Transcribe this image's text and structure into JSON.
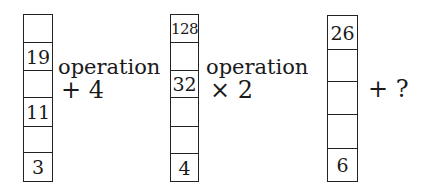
{
  "columns": [
    {
      "name": "column-1",
      "cells": [
        "",
        "19",
        "",
        "11",
        "",
        "3"
      ]
    },
    {
      "name": "column-2",
      "cells": [
        "128",
        "",
        "32",
        "",
        "",
        "4"
      ]
    },
    {
      "name": "column-3",
      "cells": [
        "26",
        "",
        "",
        "",
        "6"
      ]
    }
  ],
  "operations": [
    {
      "label": "operation",
      "value": "+ 4"
    },
    {
      "label": "operation",
      "value": "× 2"
    },
    {
      "label": "",
      "value": "+ ?"
    }
  ],
  "colors": {
    "ink": "#1a1a1a",
    "background": "#ffffff"
  }
}
